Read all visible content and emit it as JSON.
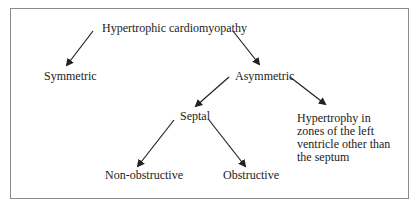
{
  "diagram": {
    "type": "classification tree",
    "nodes": {
      "root": "Hypertrophic cardiomyopathy",
      "symmetric": "Symmetric",
      "asymmetric": "Asymmetric",
      "septal": "Septal",
      "other": "Hypertrophy in zones of the left ventricle other than the septum",
      "nonobstructive": "Non-obstructive",
      "obstructive": "Obstructive"
    },
    "edges": [
      [
        "root",
        "symmetric"
      ],
      [
        "root",
        "asymmetric"
      ],
      [
        "asymmetric",
        "septal"
      ],
      [
        "asymmetric",
        "other"
      ],
      [
        "septal",
        "nonobstructive"
      ],
      [
        "septal",
        "obstructive"
      ]
    ]
  }
}
